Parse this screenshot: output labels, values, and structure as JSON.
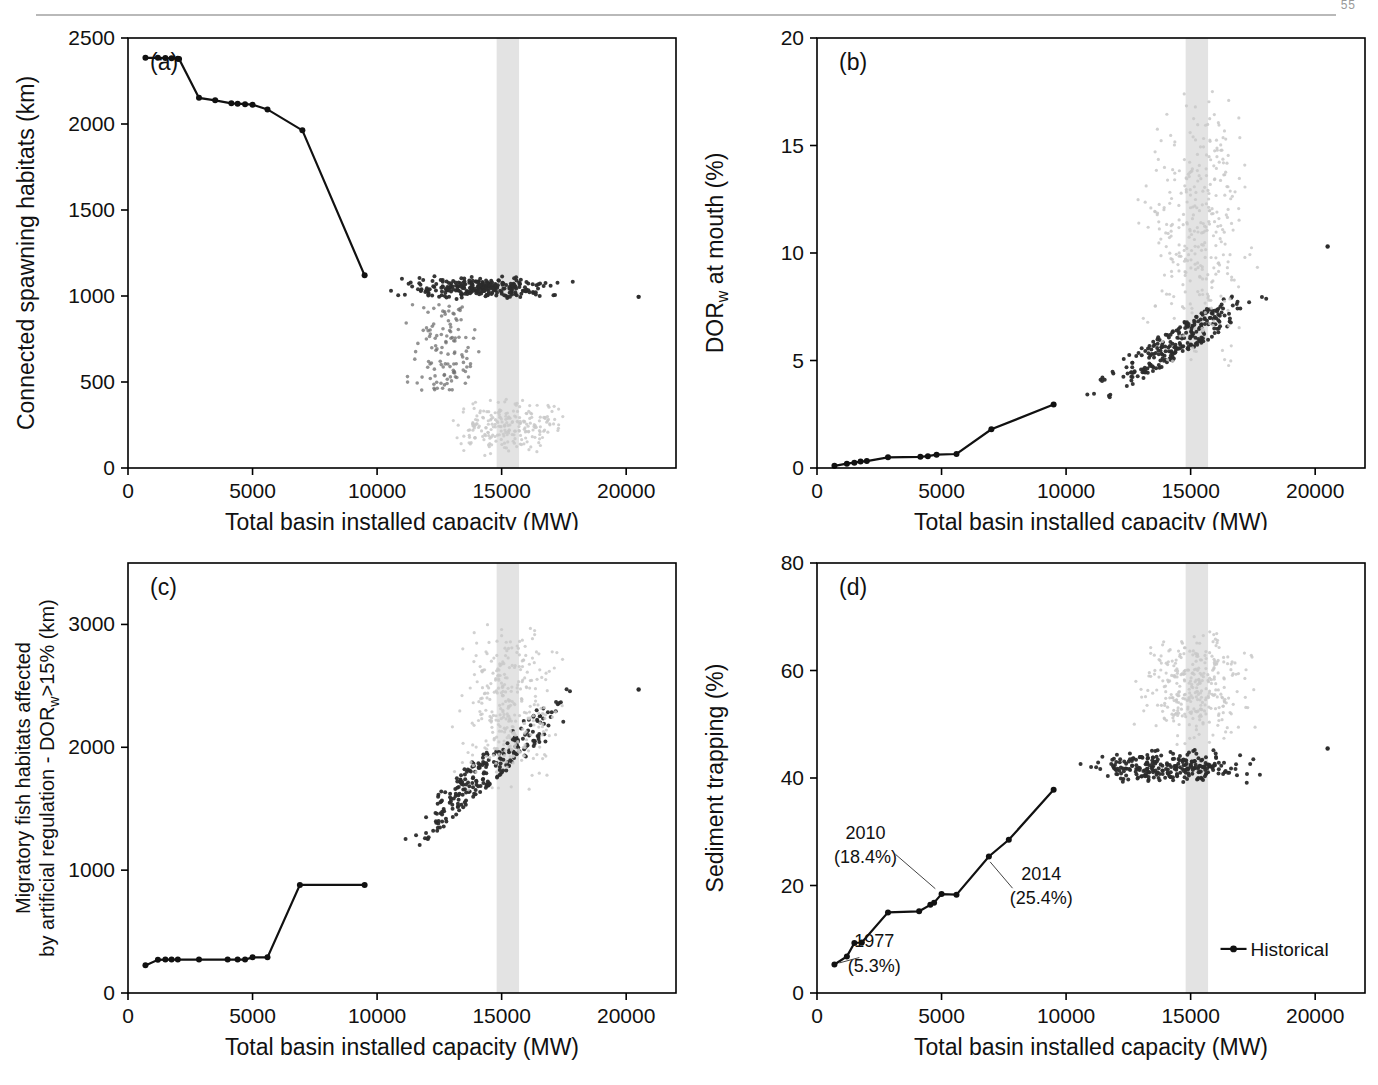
{
  "page": {
    "number": "55",
    "shared_xlabel": "Total basin installed capacity (MW)",
    "highlight_band_label": "current capacity band",
    "colors": {
      "historical_line": "#111111",
      "scatter_dark": "#2b2b2b",
      "scatter_light": "#c9c9c9",
      "band": "#e2e2e2",
      "axis": "#000000",
      "rule": "#b9b9b9"
    }
  },
  "panels": [
    {
      "tag": "(a)",
      "ylabel": "Connected spawning habitats (km)",
      "xlabel": "Total basin installed capacity (MW)",
      "yticks": [
        "0",
        "500",
        "1000",
        "1500",
        "2000",
        "2500"
      ],
      "xticks": [
        "0",
        "5000",
        "10000",
        "15000",
        "20000"
      ]
    },
    {
      "tag": "(b)",
      "ylabel": "DORw at mouth (%)",
      "ylabel_main": "DOR",
      "ylabel_sub": "w",
      "ylabel_rest": " at mouth (%)",
      "xlabel": "Total basin installed capacity (MW)",
      "yticks": [
        "0",
        "5",
        "10",
        "15",
        "20"
      ],
      "xticks": [
        "0",
        "5000",
        "10000",
        "15000",
        "20000"
      ]
    },
    {
      "tag": "(c)",
      "ylabel": "Migratory fish habitats affected by artificial regulation - DORw>15% (km)",
      "ylabel_line1": "Migratory fish habitats affected",
      "ylabel_line2_a": "by artificial regulation - DOR",
      "ylabel_line2_sub": "w",
      "ylabel_line2_b": ">15% (km)",
      "xlabel": "Total basin installed capacity (MW)",
      "yticks": [
        "0",
        "1000",
        "2000",
        "3000"
      ],
      "xticks": [
        "0",
        "5000",
        "10000",
        "15000",
        "20000"
      ]
    },
    {
      "tag": "(d)",
      "ylabel": "Sediment trapping (%)",
      "xlabel": "Total basin installed capacity (MW)",
      "yticks": [
        "0",
        "20",
        "40",
        "60",
        "80"
      ],
      "xticks": [
        "0",
        "5000",
        "10000",
        "15000",
        "20000"
      ],
      "legend": {
        "label": "Historical"
      },
      "annotations": [
        {
          "year": "1977",
          "value": "(5.3%)"
        },
        {
          "year": "2010",
          "value": "(18.4%)"
        },
        {
          "year": "2014",
          "value": "(25.4%)"
        }
      ]
    }
  ],
  "chart_data": [
    {
      "id": "a",
      "type": "scatter",
      "title": "(a)",
      "xlabel": "Total basin installed capacity (MW)",
      "ylabel": "Connected spawning habitats (km)",
      "xlim": [
        0,
        22000
      ],
      "ylim": [
        0,
        2500
      ],
      "xticks": [
        0,
        5000,
        10000,
        15000,
        20000
      ],
      "yticks": [
        0,
        500,
        1000,
        1500,
        2000,
        2500
      ],
      "grid": false,
      "legend": null,
      "highlight_band": [
        14800,
        15700
      ],
      "series": [
        {
          "name": "Historical",
          "type": "line",
          "marker": "filled-circle",
          "color": "#111111",
          "points": [
            [
              700,
              2385
            ],
            [
              1200,
              2385
            ],
            [
              1500,
              2383
            ],
            [
              1750,
              2382
            ],
            [
              2000,
              2380
            ],
            [
              2050,
              2378
            ],
            [
              2850,
              2152
            ],
            [
              3500,
              2138
            ],
            [
              4150,
              2120
            ],
            [
              4400,
              2118
            ],
            [
              4700,
              2115
            ],
            [
              5000,
              2112
            ],
            [
              5600,
              2085
            ],
            [
              7000,
              1963
            ],
            [
              9500,
              1120
            ]
          ]
        },
        {
          "name": "Scenario ensemble (dense cluster)",
          "type": "scatter",
          "color": "#2b2b2b",
          "note": "dark cloud concentrated between 1000 and 1120 km across 10000-18500 MW",
          "x_range": [
            9800,
            18600
          ],
          "y_range": [
            980,
            1120
          ],
          "n_points": 260
        },
        {
          "name": "Scenario ensemble (mid spread)",
          "type": "scatter",
          "color": "#6f6f6f",
          "note": "sparser mid-range cloud",
          "x_range": [
            11000,
            14500
          ],
          "y_range": [
            450,
            950
          ],
          "n_points": 120
        },
        {
          "name": "Scenario ensemble (low spread)",
          "type": "scatter",
          "color": "#c9c9c9",
          "note": "pale low cloud near the axis",
          "x_range": [
            11200,
            17800
          ],
          "y_range": [
            60,
            420
          ],
          "n_points": 230
        },
        {
          "name": "Outlier",
          "type": "scatter",
          "color": "#2b2b2b",
          "points": [
            [
              20500,
              995
            ]
          ]
        }
      ]
    },
    {
      "id": "b",
      "type": "scatter",
      "title": "(b)",
      "xlabel": "Total basin installed capacity (MW)",
      "ylabel": "DORw at mouth (%)",
      "xlim": [
        0,
        22000
      ],
      "ylim": [
        0,
        20
      ],
      "xticks": [
        0,
        5000,
        10000,
        15000,
        20000
      ],
      "yticks": [
        0,
        5,
        10,
        15,
        20
      ],
      "grid": false,
      "highlight_band": [
        14800,
        15700
      ],
      "series": [
        {
          "name": "Historical",
          "type": "line",
          "marker": "filled-circle",
          "color": "#111111",
          "points": [
            [
              700,
              0.1
            ],
            [
              1200,
              0.2
            ],
            [
              1500,
              0.25
            ],
            [
              1750,
              0.3
            ],
            [
              2000,
              0.32
            ],
            [
              2850,
              0.5
            ],
            [
              4150,
              0.52
            ],
            [
              4450,
              0.55
            ],
            [
              4800,
              0.62
            ],
            [
              5600,
              0.65
            ],
            [
              7000,
              1.8
            ],
            [
              9500,
              2.95
            ]
          ]
        },
        {
          "name": "Scenario ensemble (lower envelope)",
          "type": "scatter",
          "color": "#2b2b2b",
          "note": "dark band rising from ~3% at 10500 MW to ~9% at 18500 MW",
          "x_range": [
            10300,
            18600
          ],
          "y_range": [
            3.0,
            9.2
          ],
          "n_points": 250
        },
        {
          "name": "Scenario ensemble (upper spread)",
          "type": "scatter",
          "color": "#c9c9c9",
          "note": "pale vertical plume peaking near 15000-16000 MW, up to ~18%",
          "x_range": [
            11500,
            18000
          ],
          "y_range": [
            4.0,
            18.0
          ],
          "n_points": 330
        },
        {
          "name": "Outlier",
          "type": "scatter",
          "color": "#2b2b2b",
          "points": [
            [
              20500,
              10.3
            ]
          ]
        }
      ]
    },
    {
      "id": "c",
      "type": "scatter",
      "title": "(c)",
      "xlabel": "Total basin installed capacity (MW)",
      "ylabel": "Migratory fish habitats affected by artificial regulation - DORw>15% (km)",
      "xlim": [
        0,
        22000
      ],
      "ylim": [
        0,
        3500
      ],
      "xticks": [
        0,
        5000,
        10000,
        15000,
        20000
      ],
      "yticks": [
        0,
        1000,
        2000,
        3000
      ],
      "grid": false,
      "highlight_band": [
        14800,
        15700
      ],
      "series": [
        {
          "name": "Historical",
          "type": "line",
          "marker": "filled-circle",
          "color": "#111111",
          "points": [
            [
              700,
              225
            ],
            [
              1200,
              270
            ],
            [
              1500,
              272
            ],
            [
              1750,
              272
            ],
            [
              2000,
              272
            ],
            [
              2850,
              272
            ],
            [
              4000,
              272
            ],
            [
              4400,
              272
            ],
            [
              4700,
              272
            ],
            [
              5000,
              290
            ],
            [
              5600,
              290
            ],
            [
              6900,
              880
            ],
            [
              9500,
              880
            ]
          ]
        },
        {
          "name": "Scenario ensemble (dark cluster)",
          "type": "scatter",
          "color": "#2b2b2b",
          "note": "dense dark cloud between 1000 and 1500 km at 11000-13500 MW, trailing up to 2400 km",
          "x_range": [
            10500,
            18500
          ],
          "y_range": [
            900,
            2450
          ],
          "n_points": 240
        },
        {
          "name": "Scenario ensemble (pale plume)",
          "type": "scatter",
          "color": "#c9c9c9",
          "note": "pale vertical plume 1800-3000 km concentrated at 14800-16000 MW",
          "x_range": [
            12500,
            18200
          ],
          "y_range": [
            1600,
            3050
          ],
          "n_points": 320
        },
        {
          "name": "Outlier",
          "type": "scatter",
          "color": "#2b2b2b",
          "points": [
            [
              20500,
              2470
            ]
          ]
        }
      ]
    },
    {
      "id": "d",
      "type": "scatter",
      "title": "(d)",
      "xlabel": "Total basin installed capacity (MW)",
      "ylabel": "Sediment trapping (%)",
      "xlim": [
        0,
        22000
      ],
      "ylim": [
        0,
        80
      ],
      "xticks": [
        0,
        5000,
        10000,
        15000,
        20000
      ],
      "yticks": [
        0,
        20,
        40,
        60,
        80
      ],
      "grid": false,
      "highlight_band": [
        14800,
        15700
      ],
      "legend": {
        "entries": [
          "Historical"
        ],
        "position": "bottom-right"
      },
      "annotations": [
        {
          "label": "1977",
          "sub": "(5.3%)",
          "x": 700,
          "y": 5.3
        },
        {
          "label": "2010",
          "sub": "(18.4%)",
          "x": 5000,
          "y": 18.4
        },
        {
          "label": "2014",
          "sub": "(25.4%)",
          "x": 6900,
          "y": 25.4
        }
      ],
      "series": [
        {
          "name": "Historical",
          "type": "line",
          "marker": "filled-circle",
          "color": "#111111",
          "points": [
            [
              700,
              5.3
            ],
            [
              1200,
              6.8
            ],
            [
              1500,
              9.3
            ],
            [
              1800,
              9.4
            ],
            [
              2850,
              15.0
            ],
            [
              4100,
              15.2
            ],
            [
              4550,
              16.4
            ],
            [
              4700,
              16.8
            ],
            [
              5000,
              18.4
            ],
            [
              5600,
              18.3
            ],
            [
              6900,
              25.4
            ],
            [
              7700,
              28.5
            ],
            [
              9500,
              37.8
            ]
          ]
        },
        {
          "name": "Scenario ensemble (dark band)",
          "type": "scatter",
          "color": "#2b2b2b",
          "note": "dark horizontal band near 40-45% spanning 10000-18500 MW",
          "x_range": [
            9900,
            18500
          ],
          "y_range": [
            38.5,
            45.5
          ],
          "n_points": 260
        },
        {
          "name": "Scenario ensemble (pale plume)",
          "type": "scatter",
          "color": "#c9c9c9",
          "note": "pale plume 50-68% concentrated at 14500-16500 MW",
          "x_range": [
            11500,
            18000
          ],
          "y_range": [
            46,
            68
          ],
          "n_points": 320
        },
        {
          "name": "Outlier",
          "type": "scatter",
          "color": "#2b2b2b",
          "points": [
            [
              20500,
              45.5
            ]
          ]
        }
      ]
    }
  ]
}
